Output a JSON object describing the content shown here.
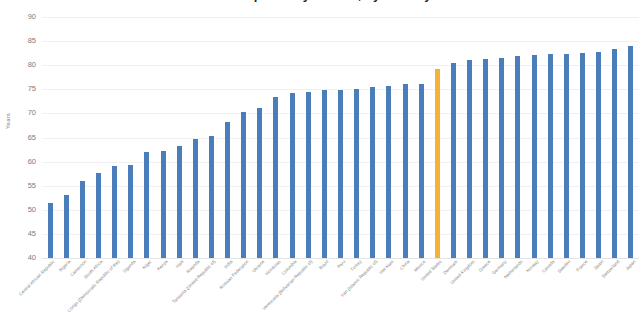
{
  "chart_data": {
    "type": "bar",
    "title": "Life expectancy at birth, by country",
    "xlabel": "",
    "ylabel": "Years",
    "ylim": [
      40,
      90
    ],
    "yticks": [
      40,
      45,
      50,
      55,
      60,
      65,
      70,
      75,
      80,
      85,
      90
    ],
    "grid": true,
    "legend": "none",
    "bar_color": "#4a7ebb",
    "highlight_color": "#f5b335",
    "highlight_category": "United States",
    "categories": [
      "Central African Republic",
      "Nigeria",
      "Cameroon",
      "South Africa",
      "Congo (Democratic Republic of the)",
      "Uganda",
      "Niger",
      "Kenya",
      "Haiti",
      "Rwanda",
      "Tanzania (United Republic of)",
      "India",
      "Russian Federation",
      "Ukraine",
      "Honduras",
      "Colombia",
      "Venezuela (Bolivarian Republic of)",
      "Brazil",
      "Peru",
      "Turkey",
      "Iran (Islamic Republic of)",
      "Viet Nam",
      "China",
      "Mexico",
      "United States",
      "Denmark",
      "United Kingdom",
      "Greece",
      "Germany",
      "Netherlands",
      "Norway",
      "Canada",
      "Sweden",
      "France",
      "Spain",
      "Switzerland",
      "Japan"
    ],
    "values": [
      51.5,
      53.1,
      56.0,
      57.7,
      59.0,
      59.3,
      62.0,
      62.3,
      63.2,
      64.7,
      65.4,
      68.3,
      70.3,
      71.2,
      73.4,
      74.2,
      74.5,
      74.8,
      74.9,
      75.1,
      75.5,
      75.6,
      76.0,
      76.1,
      79.3,
      80.4,
      81.0,
      81.3,
      81.4,
      82.0,
      82.1,
      82.3,
      82.4,
      82.5,
      82.8,
      83.4,
      84.0
    ]
  }
}
